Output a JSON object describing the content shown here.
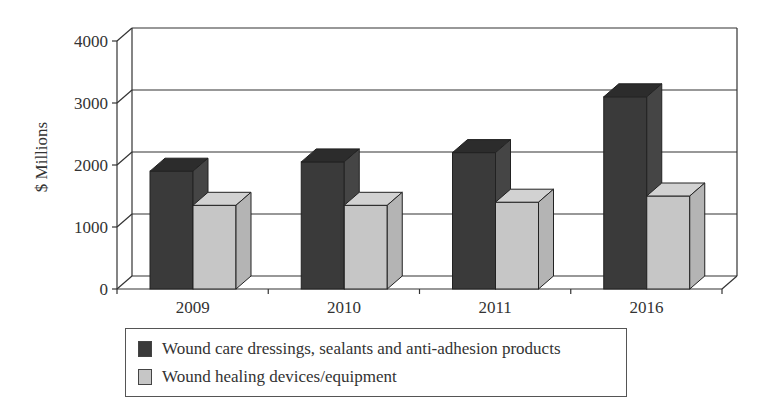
{
  "chart_data": {
    "type": "bar",
    "style": "3d-clustered-column",
    "title": "",
    "xlabel": "",
    "ylabel": "$ Millions",
    "ylim": [
      0,
      4000
    ],
    "yticks": [
      0,
      1000,
      2000,
      3000,
      4000
    ],
    "grid": true,
    "legend_position": "bottom",
    "categories": [
      "2009",
      "2010",
      "2011",
      "2016"
    ],
    "series": [
      {
        "name": "Wound care dressings, sealants and anti-adhesion products",
        "values": [
          1900,
          2050,
          2200,
          3100
        ],
        "color": "#3a3a3a",
        "top_color": "#2c2c2c",
        "side_color": "#454545"
      },
      {
        "name": "Wound healing devices/equipment",
        "values": [
          1350,
          1350,
          1400,
          1500
        ],
        "color": "#c6c6c6",
        "top_color": "#d2d2d2",
        "side_color": "#b4b4b4"
      }
    ]
  }
}
